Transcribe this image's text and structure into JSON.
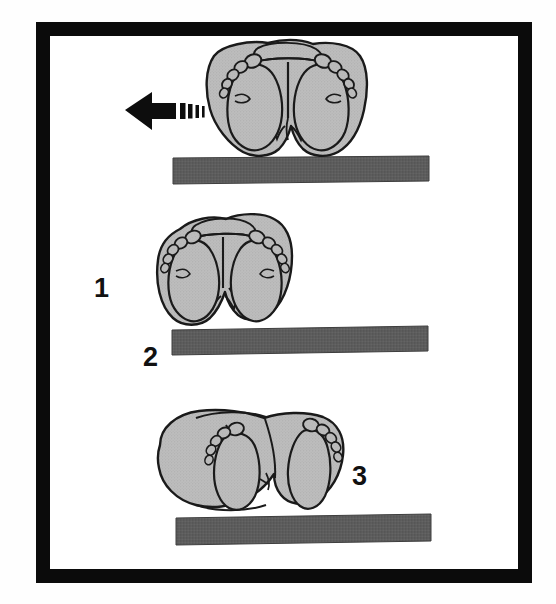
{
  "figure": {
    "caption": "",
    "frame": {
      "border_color": "#0b0b0b",
      "background_color": "#ffffff",
      "page_background": "#fefefe",
      "border_width_px": 14
    },
    "palette": {
      "body_fill": "#b9b9b9",
      "body_fill_light": "#c6c6c6",
      "body_fill_shadow": "#a8a8a8",
      "outline": "#1a1a1a",
      "surface_bar": "#5e5e5e",
      "surface_bar_dark": "#4a4a4a",
      "arrow": "#0d0d0d",
      "label_text": "#111111"
    },
    "labels": [
      {
        "id": "label-1",
        "text": "1",
        "name": "stage-label-1"
      },
      {
        "id": "label-2",
        "text": "2",
        "name": "stage-label-2"
      },
      {
        "id": "label-3",
        "text": "3",
        "name": "stage-label-3"
      }
    ],
    "arrow": {
      "direction": "left",
      "motion_bars": 4,
      "description": "left-pointing motion arrow with speed lines"
    },
    "panels": [
      {
        "index": 1,
        "name": "panel-top",
        "label": "",
        "description": "Fetal buttocks and both feet seen from below, soles facing viewer, resting above the support surface",
        "feet_visible": 2,
        "toes_per_foot": 5,
        "has_surface_bar": true
      },
      {
        "index": 2,
        "name": "panel-middle",
        "label": "1",
        "secondary_label": "2",
        "description": "Buttocks rotated, one hip overhanging the edge of the support surface",
        "feet_visible": 2,
        "toes_per_foot": 5,
        "has_surface_bar": true
      },
      {
        "index": 3,
        "name": "panel-bottom",
        "label": "3",
        "description": "Body lying on its side across the support surface with both feet extended to the right",
        "feet_visible": 2,
        "toes_per_foot": 5,
        "has_surface_bar": true
      }
    ]
  }
}
